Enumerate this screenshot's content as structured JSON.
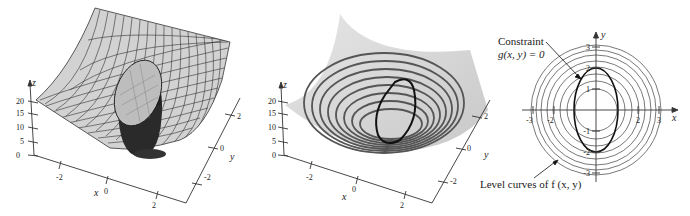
{
  "figure": {
    "panels": [
      {
        "id": "surface-with-constraint-cylinder",
        "z_axis": {
          "label": "z",
          "ticks": [
            "0",
            "5",
            "10",
            "15",
            "20"
          ]
        },
        "x_axis": {
          "label": "x",
          "ticks": [
            "-2",
            "0",
            "2"
          ]
        },
        "y_axis": {
          "label": "y",
          "ticks": [
            "-2",
            "0",
            "2"
          ]
        }
      },
      {
        "id": "surface-with-level-curves",
        "z_axis": {
          "label": "z",
          "ticks": [
            "0",
            "5",
            "10",
            "15",
            "20"
          ]
        },
        "x_axis": {
          "label": "x",
          "ticks": [
            "-2",
            "0",
            "2"
          ]
        },
        "y_axis": {
          "label": "y",
          "ticks": [
            "-2",
            "0",
            "2"
          ]
        }
      },
      {
        "id": "level-curves-2d",
        "x_axis": {
          "label": "x",
          "ticks": [
            "-3",
            "-2",
            "2",
            "3"
          ]
        },
        "y_axis": {
          "label": "y",
          "ticks": [
            "3",
            "2",
            "1",
            "-1",
            "-2",
            "-3"
          ]
        },
        "annotations": {
          "constraint_title": "Constraint",
          "constraint_eq": "g(x, y) = 0",
          "level_curves": "Level curves of  f (x, y)"
        }
      }
    ],
    "colors": {
      "surface_fill": "#d4d4d4",
      "mesh_line": "#3a3a3a",
      "contour": "#555555",
      "constraint": "#111111",
      "axis": "#333333"
    }
  }
}
